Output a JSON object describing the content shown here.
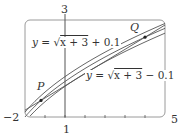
{
  "chart_data": {
    "type": "line",
    "title": "",
    "xlabel": "",
    "ylabel": "",
    "xlim": [
      -2,
      5
    ],
    "ylim": [
      1,
      3
    ],
    "grid": false,
    "tick_labels": {
      "x_left": "−2",
      "x_right": "5",
      "x_axis_marker": "1",
      "y_top": "3"
    },
    "x_ticks": [
      -1,
      0,
      1,
      2,
      3,
      4
    ],
    "series": [
      {
        "name": "y = √(x+3) + 0.1",
        "label_prefix": "y = √",
        "label_radicand": "x + 3",
        "label_suffix": " + 0.1",
        "offset": 0.1
      },
      {
        "name": "y = √(x+3)",
        "offset": 0.0
      },
      {
        "name": "y = √(x+3) − 0.1",
        "label_prefix": "y = √",
        "label_radicand": "x + 3",
        "label_suffix": " − 0.1",
        "offset": -0.1
      }
    ],
    "secant_line": {
      "through": [
        "P",
        "Q"
      ]
    },
    "points": [
      {
        "label": "P",
        "x": -1.2
      },
      {
        "label": "Q",
        "x": 4.0
      }
    ]
  },
  "labels": {
    "upper": {
      "prefix": "y = ",
      "sqrt": "√",
      "radicand": "x + 3",
      "suffix": " + 0.1"
    },
    "lower": {
      "prefix": "y = ",
      "sqrt": "√",
      "radicand": "x + 3",
      "suffix": " − 0.1"
    },
    "P": "P",
    "Q": "Q",
    "x_left": "−2",
    "x_right": "5",
    "x_axis_marker": "1",
    "y_top": "3"
  },
  "colors": {
    "frame": "#9a9a9a",
    "curve": "#555555",
    "text": "#333333"
  }
}
